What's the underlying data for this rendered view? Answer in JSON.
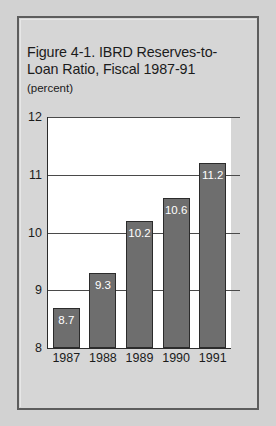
{
  "figure": {
    "title": "Figure 4-1.  IBRD Reserves-to-\nLoan Ratio, Fiscal 1987-91",
    "subtitle": "(percent)"
  },
  "colors": {
    "panel_background": "#d6d6d6",
    "page_background": "#d2d2d2",
    "plot_background": "#ffffff",
    "bar_fill": "#6e6e6e",
    "bar_outline": "#2b2b2b",
    "gridline": "#4a4a4a",
    "text": "#1b1b1b",
    "bar_label_text": "#ffffff"
  },
  "chart_data": {
    "type": "bar",
    "subtitle": "(percent)",
    "xlabel": "",
    "ylabel": "",
    "categories": [
      "1987",
      "1988",
      "1989",
      "1990",
      "1991"
    ],
    "values": [
      8.7,
      9.3,
      10.2,
      10.6,
      11.2
    ],
    "data_labels": [
      "8.7",
      "9.3",
      "10.2",
      "10.6",
      "11.2"
    ],
    "ylim": [
      8,
      12
    ],
    "yticks": [
      8,
      9,
      10,
      11,
      12
    ],
    "ytick_labels": [
      "8",
      "9",
      "10",
      "11",
      "12"
    ],
    "grid": true,
    "legend": false
  }
}
